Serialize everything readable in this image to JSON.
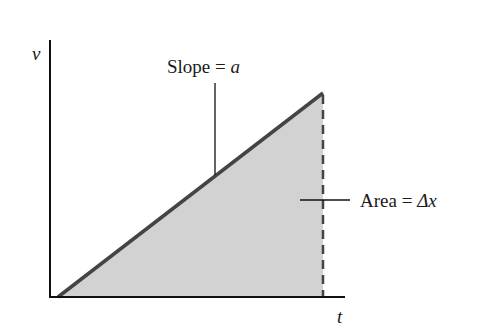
{
  "diagram": {
    "type": "velocity-time graph",
    "axes": {
      "y_label": "v",
      "x_label": "t"
    },
    "slope_label": {
      "text": "Slope = ",
      "var": "a"
    },
    "area_label": {
      "text": "Area = ",
      "var": "Δx"
    },
    "colors": {
      "line": "#444444",
      "fill": "#d2d2d2",
      "axis": "#111111"
    }
  }
}
